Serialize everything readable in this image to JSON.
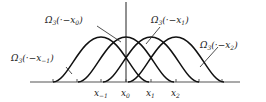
{
  "diagram": {
    "type": "overlapping-bump-functions",
    "curve_color": "#111111",
    "axis_color": "#555555",
    "curves": [
      {
        "center_label": "x_{-1}",
        "label": "Ω₃(·−x₋₁)",
        "label_base": "Ω",
        "label_sub": "3",
        "label_arg": "(·−x",
        "label_arg_sub": "−1",
        "label_close": ")"
      },
      {
        "center_label": "x_0",
        "label": "Ω₃(·−x₀)",
        "label_base": "Ω",
        "label_sub": "3",
        "label_arg": "(·−x",
        "label_arg_sub": "0",
        "label_close": ")"
      },
      {
        "center_label": "x_1",
        "label": "Ω₃(·−x₁)",
        "label_base": "Ω",
        "label_sub": "3",
        "label_arg": "(·−x",
        "label_arg_sub": "1",
        "label_close": ")"
      },
      {
        "center_label": "x_2",
        "label": "Ω₃(·−x₂)",
        "label_base": "Ω",
        "label_sub": "3",
        "label_arg": "(·−x",
        "label_arg_sub": "2",
        "label_close": ")"
      }
    ],
    "x_ticks": [
      {
        "base": "x",
        "sub": "−1"
      },
      {
        "base": "x",
        "sub": "0"
      },
      {
        "base": "x",
        "sub": "1"
      },
      {
        "base": "x",
        "sub": "2"
      }
    ]
  }
}
